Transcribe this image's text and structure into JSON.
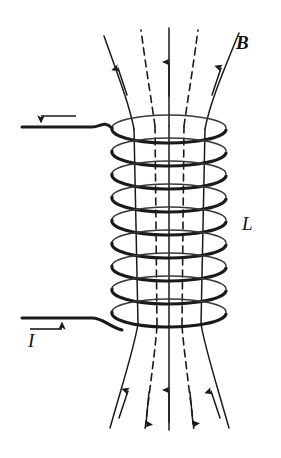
{
  "figure": {
    "kind": "physics-diagram",
    "background_color": "#ffffff",
    "ink_color": "#1a1a1a",
    "width": 281,
    "height": 458
  },
  "labels": {
    "field_label": "B",
    "inductance_label": "L",
    "current_label": "I"
  },
  "annotations": {
    "top_lead_arrow_direction": "left",
    "bottom_lead_arrow_direction": "right",
    "field_direction_inside": "up",
    "top_exterior_arrows": "up",
    "bottom_exterior_solid_arrows": "up",
    "bottom_exterior_dashed_arrows": "down"
  },
  "solenoid": {
    "turns": 9,
    "coil_left": 112,
    "coil_right": 226,
    "coil_top": 122,
    "coil_bottom": 328,
    "turn_spacing": 23,
    "ellipse_rx": 57,
    "ellipse_ry": 13
  },
  "field_lines": {
    "count": 5,
    "styles": [
      "solid",
      "dashed",
      "solid",
      "dashed",
      "solid"
    ],
    "x_positions_inside": [
      137,
      158,
      169,
      181,
      202
    ]
  }
}
